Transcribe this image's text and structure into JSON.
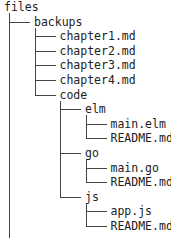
{
  "tree": {
    "root": "files",
    "rows": [
      {
        "label": "backups",
        "depth": 1
      },
      {
        "label": "chapter1.md",
        "depth": 2
      },
      {
        "label": "chapter2.md",
        "depth": 2
      },
      {
        "label": "chapter3.md",
        "depth": 2
      },
      {
        "label": "chapter4.md",
        "depth": 2
      },
      {
        "label": "code",
        "depth": 2
      },
      {
        "label": "elm",
        "depth": 3
      },
      {
        "label": "main.elm",
        "depth": 4
      },
      {
        "label": "README.md",
        "depth": 4
      },
      {
        "label": "go",
        "depth": 3
      },
      {
        "label": "main.go",
        "depth": 4
      },
      {
        "label": "README.md",
        "depth": 4
      },
      {
        "label": "js",
        "depth": 3
      },
      {
        "label": "app.js",
        "depth": 4
      },
      {
        "label": "README.md",
        "depth": 4
      }
    ]
  }
}
